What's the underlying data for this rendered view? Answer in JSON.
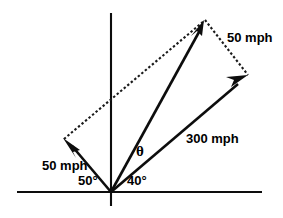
{
  "figure": {
    "background_color": "#ffffff",
    "stroke_color": "#0d0d0d",
    "width": 283,
    "height": 218
  },
  "axes": {
    "origin": {
      "x": 111,
      "y": 192
    },
    "horizontal": {
      "x1": 17,
      "y1": 192,
      "x2": 262,
      "y2": 192
    },
    "vertical": {
      "x1": 111,
      "y1": 13,
      "x2": 111,
      "y2": 206
    }
  },
  "labels": {
    "wind_vector": "50 mph",
    "side_vector": "50 mph",
    "plane_vector": "300 mph",
    "angle_left": "50°",
    "angle_right": "40°",
    "resultant_angle": "θ"
  },
  "label_positions": {
    "wind_vector": {
      "x": 42,
      "y": 167
    },
    "side_vector": {
      "x": 227,
      "y": 39
    },
    "plane_vector": {
      "x": 186,
      "y": 140
    },
    "angle_left": {
      "x": 78,
      "y": 182
    },
    "angle_right": {
      "x": 127,
      "y": 182
    },
    "resultant_angle": {
      "x": 136,
      "y": 153
    }
  },
  "vectors": [
    {
      "name": "wind-50mph-vector",
      "label": "50 mph",
      "magnitude": 50,
      "unit": "mph",
      "angle_from_positive_x_axis_deg": 130,
      "from": {
        "x": 111,
        "y": 192
      },
      "to": {
        "x": 64,
        "y": 139
      },
      "style": "solid",
      "arrowhead": "end"
    },
    {
      "name": "plane-300mph-vector",
      "label": "300 mph",
      "magnitude": 300,
      "unit": "mph",
      "angle_from_positive_x_axis_deg": 40,
      "from": {
        "x": 111,
        "y": 192
      },
      "to": {
        "x": 247,
        "y": 76
      },
      "style": "solid",
      "arrowhead": "end"
    },
    {
      "name": "resultant-vector",
      "label": "θ",
      "magnitude": null,
      "unit": "mph",
      "angle_from_positive_x_axis_deg": 60,
      "from": {
        "x": 111,
        "y": 192
      },
      "to": {
        "x": 204,
        "y": 21
      },
      "style": "solid",
      "arrowhead": "end"
    }
  ],
  "construction_lines": [
    {
      "name": "parallelogram-upper-left-side",
      "from": {
        "x": 64,
        "y": 139
      },
      "to": {
        "x": 204,
        "y": 21
      },
      "style": "dotted"
    },
    {
      "name": "parallelogram-upper-right-side",
      "from": {
        "x": 204,
        "y": 21
      },
      "to": {
        "x": 247,
        "y": 76
      },
      "style": "dotted"
    }
  ],
  "angles": [
    {
      "name": "angle-50-degrees",
      "value": "50°",
      "between": [
        "positive-x-axis-left",
        "wind-50mph-vector"
      ]
    },
    {
      "name": "angle-40-degrees",
      "value": "40°",
      "between": [
        "positive-x-axis",
        "plane-300mph-vector"
      ]
    },
    {
      "name": "angle-theta",
      "value": "θ",
      "between": [
        "resultant-vector",
        "plane-300mph-vector"
      ]
    }
  ]
}
